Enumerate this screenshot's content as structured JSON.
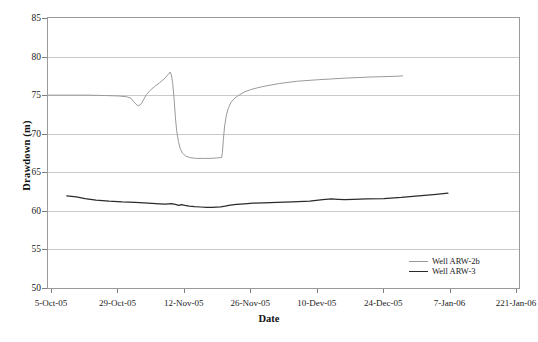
{
  "chart_data": {
    "type": "line",
    "title": "",
    "xlabel": "Date",
    "ylabel": "Drawdown (m)",
    "ylim": [
      50,
      85
    ],
    "ytick_labels": [
      "50",
      "55",
      "60",
      "65",
      "70",
      "75",
      "80",
      "85"
    ],
    "ytick_values": [
      50,
      55,
      60,
      65,
      70,
      75,
      80,
      85
    ],
    "xtick_labels": [
      "5-Oct-05",
      "29-Oct-05",
      "12-Nov-05",
      "26-Nov-05",
      "10-Dev-05",
      "24-Dec-05",
      "7-Jan-06",
      "221-Jan-06"
    ],
    "grid": "horizontal",
    "legend_position": "inside-bottom-right",
    "series": [
      {
        "name": "Well ARW-2b",
        "color": "#9a9a9a",
        "x": [
          0.0,
          2.0,
          5.0,
          9.0,
          13.0,
          16.0,
          18.0,
          19.0,
          19.6,
          20.2,
          20.8,
          21.4,
          22.0,
          22.6,
          23.4,
          24.4,
          25.6,
          26.8,
          27.6,
          28.0,
          28.3,
          28.6,
          28.9,
          29.2,
          29.5,
          29.9,
          30.3,
          30.8,
          31.6,
          32.6,
          34.0,
          35.6,
          37.2,
          38.6,
          39.4,
          39.8,
          40.0,
          40.2,
          40.5,
          40.9,
          41.4,
          42.0,
          42.8,
          43.8,
          45.0,
          46.4,
          48.0,
          50.0,
          53.0,
          57.0,
          62.0,
          68.0,
          74.0,
          80.0,
          81.3
        ],
        "y": [
          75.0,
          75.0,
          75.0,
          75.0,
          74.95,
          74.9,
          74.8,
          74.6,
          74.2,
          73.8,
          73.6,
          73.9,
          74.5,
          75.1,
          75.6,
          76.1,
          76.6,
          77.2,
          77.7,
          78.0,
          77.6,
          76.5,
          74.6,
          72.2,
          70.4,
          69.0,
          68.1,
          67.5,
          67.1,
          66.9,
          66.8,
          66.8,
          66.8,
          66.85,
          66.9,
          66.9,
          67.6,
          69.2,
          71.0,
          72.4,
          73.4,
          74.1,
          74.6,
          75.0,
          75.4,
          75.7,
          75.95,
          76.2,
          76.5,
          76.8,
          77.0,
          77.2,
          77.35,
          77.45,
          77.5
        ]
      },
      {
        "name": "Well ARW-3",
        "color": "#2b2b2b",
        "x": [
          4.3,
          6.5,
          8.5,
          11.0,
          14.0,
          17.0,
          20.0,
          23.0,
          25.5,
          27.0,
          28.3,
          29.2,
          30.0,
          30.6,
          31.4,
          32.4,
          33.6,
          35.0,
          36.4,
          37.6,
          38.6,
          39.6,
          40.6,
          41.8,
          43.2,
          45.0,
          47.0,
          49.5,
          52.5,
          56.0,
          60.0,
          63.0,
          65.0,
          66.5,
          68.0,
          70.0,
          73.0,
          77.0,
          81.0,
          85.0,
          89.0,
          91.7
        ],
        "y": [
          61.95,
          61.8,
          61.6,
          61.4,
          61.25,
          61.15,
          61.1,
          61.0,
          60.92,
          60.88,
          60.95,
          60.85,
          60.72,
          60.8,
          60.7,
          60.62,
          60.55,
          60.5,
          60.45,
          60.45,
          60.48,
          60.52,
          60.6,
          60.75,
          60.85,
          60.92,
          61.0,
          61.05,
          61.1,
          61.15,
          61.25,
          61.45,
          61.55,
          61.5,
          61.45,
          61.5,
          61.55,
          61.6,
          61.75,
          61.95,
          62.15,
          62.3
        ]
      }
    ]
  },
  "axes": {
    "y_title": "Drawdown (m)",
    "x_title": "Date"
  },
  "legend": {
    "entries": [
      {
        "label": "Well ARW-2b",
        "color": "#9a9a9a"
      },
      {
        "label": "Well ARW-3",
        "color": "#2b2b2b"
      }
    ]
  },
  "caption": ""
}
